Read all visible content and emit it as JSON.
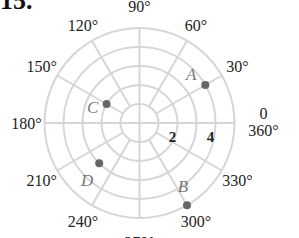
{
  "problem": {
    "number": "15."
  },
  "chart_data": {
    "type": "polar-grid",
    "title": "",
    "rings": [
      1,
      2,
      3,
      4,
      5
    ],
    "radial_tick_labels": [
      {
        "value": 2,
        "label": "2"
      },
      {
        "value": 4,
        "label": "4"
      }
    ],
    "angle_step_deg": 30,
    "angle_labels": [
      {
        "angle": 0,
        "label": "0"
      },
      {
        "angle": 30,
        "label": "30°"
      },
      {
        "angle": 60,
        "label": "60°"
      },
      {
        "angle": 90,
        "label": "90°"
      },
      {
        "angle": 120,
        "label": "120°"
      },
      {
        "angle": 150,
        "label": "150°"
      },
      {
        "angle": 180,
        "label": "180°"
      },
      {
        "angle": 210,
        "label": "210°"
      },
      {
        "angle": 240,
        "label": "240°"
      },
      {
        "angle": 270,
        "label": "270°"
      },
      {
        "angle": 300,
        "label": "300°"
      },
      {
        "angle": 330,
        "label": "330°"
      },
      {
        "angle": 360,
        "label": "360°"
      }
    ],
    "points": [
      {
        "name": "A",
        "r": 4,
        "theta_deg": 30
      },
      {
        "name": "B",
        "r": 5,
        "theta_deg": 300
      },
      {
        "name": "C",
        "r": 2,
        "theta_deg": 150
      },
      {
        "name": "D",
        "r": 3,
        "theta_deg": 225
      }
    ]
  },
  "colors": {
    "grid": "#d6d6d6",
    "point": "#666666",
    "point_label": "#777777",
    "text": "#222222"
  }
}
